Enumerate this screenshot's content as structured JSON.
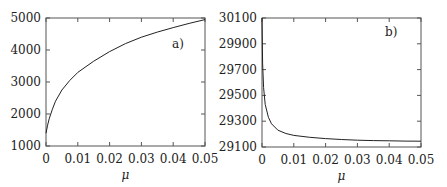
{
  "chart_data": [
    {
      "type": "line",
      "panel_label": "a)",
      "title": "",
      "xlabel": "μ",
      "ylabel": "",
      "xlim": [
        0,
        0.05
      ],
      "ylim": [
        1000,
        5000
      ],
      "xticks": [
        0,
        0.01,
        0.02,
        0.03,
        0.04,
        0.05
      ],
      "xtick_labels": [
        "0",
        "0.01",
        "0.02",
        "0.03",
        "0.04",
        "0.05"
      ],
      "yticks": [
        1000,
        2000,
        3000,
        4000,
        5000
      ],
      "ytick_labels": [
        "1000",
        "2000",
        "3000",
        "4000",
        "5000"
      ],
      "grid": false,
      "series": [
        {
          "name": "a",
          "x": [
            0,
            0.0005,
            0.001,
            0.002,
            0.003,
            0.005,
            0.0075,
            0.01,
            0.015,
            0.02,
            0.025,
            0.03,
            0.035,
            0.04,
            0.045,
            0.05
          ],
          "y": [
            1400,
            1650,
            1850,
            2150,
            2400,
            2750,
            3050,
            3300,
            3650,
            3950,
            4200,
            4400,
            4560,
            4700,
            4830,
            4950
          ]
        }
      ]
    },
    {
      "type": "line",
      "panel_label": "b)",
      "title": "",
      "xlabel": "μ",
      "ylabel": "",
      "xlim": [
        0,
        0.05
      ],
      "ylim": [
        29100,
        30100
      ],
      "xticks": [
        0,
        0.01,
        0.02,
        0.03,
        0.04,
        0.05
      ],
      "xtick_labels": [
        "0",
        "0.01",
        "0.02",
        "0.03",
        "0.04",
        "0.05"
      ],
      "yticks": [
        29100,
        29300,
        29500,
        29700,
        29900,
        30100
      ],
      "ytick_labels": [
        "29100",
        "29300",
        "29500",
        "29700",
        "29900",
        "30100"
      ],
      "grid": false,
      "series": [
        {
          "name": "b",
          "x": [
            0,
            0.0002,
            0.0005,
            0.001,
            0.002,
            0.003,
            0.005,
            0.0075,
            0.01,
            0.015,
            0.02,
            0.025,
            0.03,
            0.035,
            0.04,
            0.045,
            0.05
          ],
          "y": [
            30100,
            29750,
            29560,
            29430,
            29330,
            29280,
            29230,
            29205,
            29190,
            29175,
            29165,
            29158,
            29153,
            29150,
            29148,
            29146,
            29145
          ]
        }
      ]
    }
  ]
}
